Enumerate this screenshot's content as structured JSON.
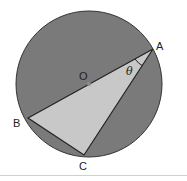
{
  "diagram": {
    "title": "",
    "circle": {
      "center": "O",
      "fill": "#7a7a7a",
      "stroke": "#333333"
    },
    "triangle": {
      "vertices": [
        "A",
        "B",
        "C"
      ],
      "fill": "#c8c8c8"
    },
    "labels": {
      "A": "A",
      "B": "B",
      "C": "C",
      "O": "O",
      "angle": "θ"
    }
  }
}
